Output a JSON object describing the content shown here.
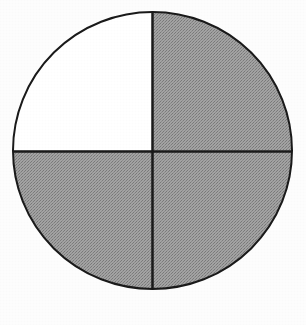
{
  "figure": {
    "background_color": "#fdfdfd",
    "outline_color": "#1a1a1a",
    "outline_width": 2,
    "divider_color": "#1a1a1a",
    "divider_width": 2.5,
    "shaded_color": "#9a9a9a",
    "unshaded_color": "#ffffff",
    "circle": {
      "center_x": 152.5,
      "center_y": 150.5,
      "radius_x": 139.5,
      "radius_y": 138.5
    }
  },
  "chart_data": {
    "type": "pie",
    "categories": [
      "top-left quadrant",
      "top-right quadrant",
      "bottom-right quadrant",
      "bottom-left quadrant"
    ],
    "values": [
      25,
      25,
      25,
      25
    ],
    "labels": [
      "",
      "",
      "",
      ""
    ],
    "colors": [
      "#9a9a9a",
      "#ffffff",
      "#9a9a9a",
      "#9a9a9a"
    ],
    "shaded": [
      true,
      false,
      true,
      true
    ],
    "shaded_count": 3,
    "total_parts": 4,
    "fraction_shaded": "3/4",
    "legend": [],
    "xlabel": "",
    "ylabel": "",
    "grid": false
  },
  "quadrants": [
    {
      "name": "top-left",
      "fill": "#9a9a9a",
      "shaded": "shaded",
      "start_angle": 180,
      "end_angle": 270
    },
    {
      "name": "top-right",
      "fill": "#ffffff",
      "shaded": "unshaded",
      "start_angle": 270,
      "end_angle": 360
    },
    {
      "name": "bottom-right",
      "fill": "#9a9a9a",
      "shaded": "shaded",
      "start_angle": 0,
      "end_angle": 90
    },
    {
      "name": "bottom-left",
      "fill": "#9a9a9a",
      "shaded": "shaded",
      "start_angle": 90,
      "end_angle": 180
    }
  ]
}
